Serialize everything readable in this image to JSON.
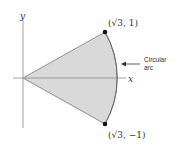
{
  "diagram": {
    "axes": {
      "x_label": "x",
      "y_label": "y"
    },
    "points": [
      {
        "label": "(√3, 1)",
        "x_text": "(",
        "sqrt": "√",
        "inner": "3, 1)"
      },
      {
        "label": "(√3, −1)",
        "x_text": "(",
        "sqrt": "√",
        "inner": "3, −1)"
      }
    ],
    "annotation": {
      "line1": "Circular",
      "line2": "arc"
    },
    "colors": {
      "fill": "#d9d9d9",
      "stroke": "#777777",
      "axis": "#8a8a8a",
      "point": "#111111",
      "text": "#333333"
    }
  }
}
